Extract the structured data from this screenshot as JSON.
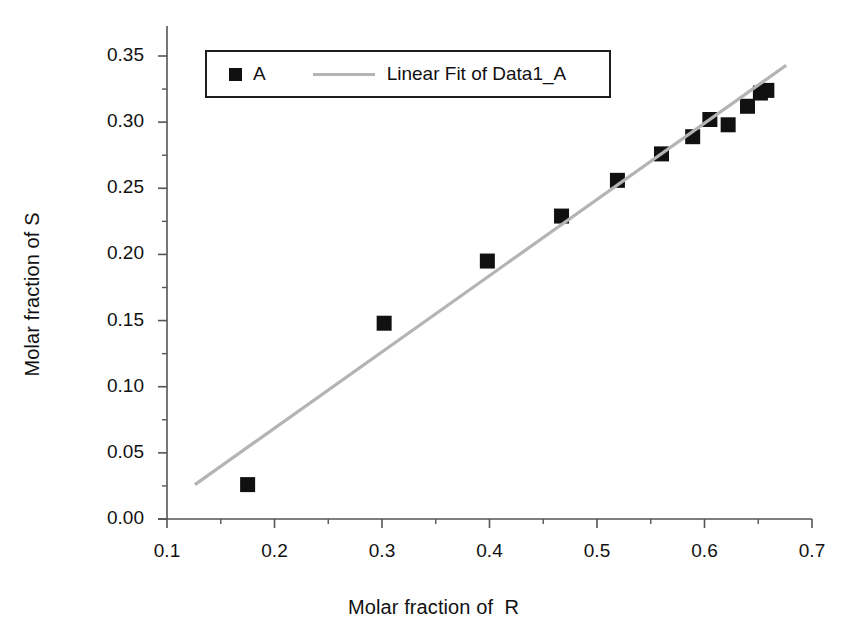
{
  "chart_data": {
    "type": "scatter",
    "title": "",
    "subtitle": "",
    "xlabel": "Molar fraction of  R",
    "ylabel": "Molar fraction of S",
    "xlim": [
      0.1,
      0.7
    ],
    "ylim": [
      0.0,
      0.35
    ],
    "xticks": [
      "0.1",
      "0.2",
      "0.3",
      "0.4",
      "0.5",
      "0.6",
      "0.7"
    ],
    "xtick_values": [
      0.1,
      0.2,
      0.3,
      0.4,
      0.5,
      0.6,
      0.7
    ],
    "yticks": [
      "0.00",
      "0.05",
      "0.10",
      "0.15",
      "0.20",
      "0.25",
      "0.30",
      "0.35"
    ],
    "ytick_values": [
      0.0,
      0.05,
      0.1,
      0.15,
      0.2,
      0.25,
      0.3,
      0.35
    ],
    "minor_ticks": true,
    "grid": false,
    "legend_position": "top-left-inside",
    "marker_color": "#111111",
    "fit_line_color": "#b4b4b4",
    "axis_color": "#555555",
    "series": [
      {
        "name": "A",
        "type": "scatter",
        "marker": "square",
        "x": [
          0.175,
          0.302,
          0.398,
          0.467,
          0.519,
          0.56,
          0.589,
          0.605,
          0.622,
          0.64,
          0.652,
          0.658
        ],
        "y": [
          0.026,
          0.148,
          0.195,
          0.229,
          0.256,
          0.276,
          0.289,
          0.302,
          0.298,
          0.312,
          0.322,
          0.324
        ]
      },
      {
        "name": "Linear Fit of Data1_A",
        "type": "line",
        "x": [
          0.126,
          0.676
        ],
        "y": [
          0.026,
          0.343
        ]
      }
    ]
  },
  "legend": {
    "entries": [
      {
        "label": "A",
        "symbol": "filled-square",
        "color": "#111111"
      },
      {
        "label": "Linear Fit of Data1_A",
        "symbol": "line",
        "color": "#b4b4b4"
      }
    ]
  },
  "axes": {
    "x_title": "Molar fraction of  R",
    "y_title": "Molar fraction of S",
    "x_tick_labels": [
      "0.1",
      "0.2",
      "0.3",
      "0.4",
      "0.5",
      "0.6",
      "0.7"
    ],
    "y_tick_labels": [
      "0.00",
      "0.05",
      "0.10",
      "0.15",
      "0.20",
      "0.25",
      "0.30",
      "0.35"
    ]
  }
}
